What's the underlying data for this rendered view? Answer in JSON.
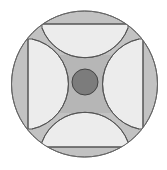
{
  "diagram": {
    "colors": {
      "background": "#ffffff",
      "outer_ring": "#c2c2c2",
      "light_region": "#ececec",
      "gap_region": "#b6b6b6",
      "center_circle": "#7c7c7c",
      "stroke": "#555555"
    },
    "outer_circle": {
      "cx": 84.5,
      "cy": 84,
      "r": 73
    },
    "center_circle": {
      "cx": 85,
      "cy": 82,
      "r": 13
    },
    "regions": [
      {
        "name": "top",
        "edge": [
          [
            42,
            24
          ],
          [
            128,
            24
          ]
        ],
        "arc_apex": [
          85,
          68
        ]
      },
      {
        "name": "bottom",
        "edge": [
          [
            42,
            147
          ],
          [
            128,
            147
          ]
        ],
        "arc_apex": [
          85,
          99
        ]
      },
      {
        "name": "left",
        "edge": [
          [
            28,
            39
          ],
          [
            28,
            129
          ]
        ],
        "arc_apex": [
          70,
          84
        ]
      },
      {
        "name": "right",
        "edge": [
          [
            143,
            39
          ],
          [
            143,
            129
          ]
        ],
        "arc_apex": [
          100,
          84
        ]
      }
    ]
  }
}
